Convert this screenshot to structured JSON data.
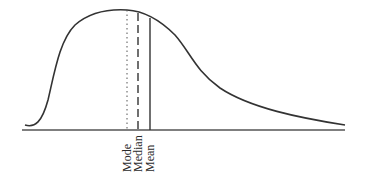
{
  "diagram": {
    "title": "",
    "type": "right-skewed distribution",
    "colors": {
      "curve": "#333333",
      "axis": "#555555",
      "text": "#2a2a2a"
    },
    "lines": [
      {
        "name": "mode",
        "style": "dotted",
        "label": "Mode"
      },
      {
        "name": "median",
        "style": "dashed",
        "label": "Median"
      },
      {
        "name": "mean",
        "style": "solid",
        "label": "Mean"
      }
    ]
  }
}
